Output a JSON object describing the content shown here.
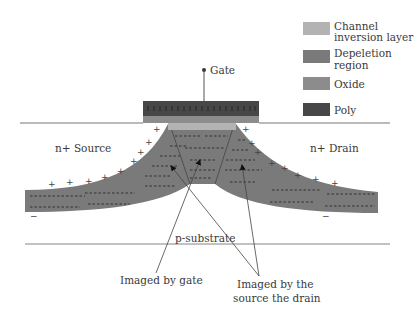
{
  "colors": {
    "channel": "#b3b3b3",
    "depletion": "#7a7a7a",
    "oxide": "#8c8c8c",
    "poly": "#474747",
    "line": "#555555",
    "background": "#ffffff"
  },
  "legend": [
    {
      "key": "channel",
      "label_lines": [
        "Channel",
        "inversion layer"
      ]
    },
    {
      "key": "depletion",
      "label_lines": [
        "Depeletion",
        "region"
      ]
    },
    {
      "key": "oxide",
      "label_lines": [
        "Oxide"
      ]
    },
    {
      "key": "poly",
      "label_lines": [
        "Poly"
      ]
    }
  ],
  "labels": {
    "gate": "Gate",
    "source": "n+ Source",
    "drain": "n+ Drain",
    "substrate": "p-substrate",
    "imaged_by_gate": "Imaged by gate",
    "imaged_by_sd_line1": "Imaged by the",
    "imaged_by_sd_line2": "source the drain"
  },
  "symbols": {
    "plus": "+",
    "minus": "−"
  }
}
